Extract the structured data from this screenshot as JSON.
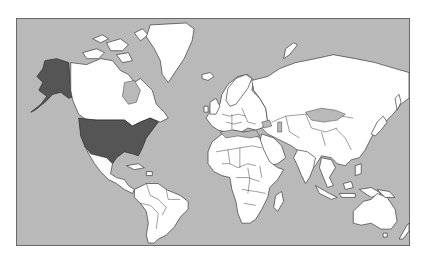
{
  "map": {
    "type": "world-choropleth",
    "projection": "mercator",
    "colors": {
      "ocean": "#b9b9b9",
      "land": "#ffffff",
      "highlight": "#555555",
      "border": "#3a3a3a",
      "frame": "#6a6a6a"
    },
    "highlighted_regions": [
      "United States (contiguous)",
      "Alaska"
    ],
    "legend": null,
    "title": null
  }
}
